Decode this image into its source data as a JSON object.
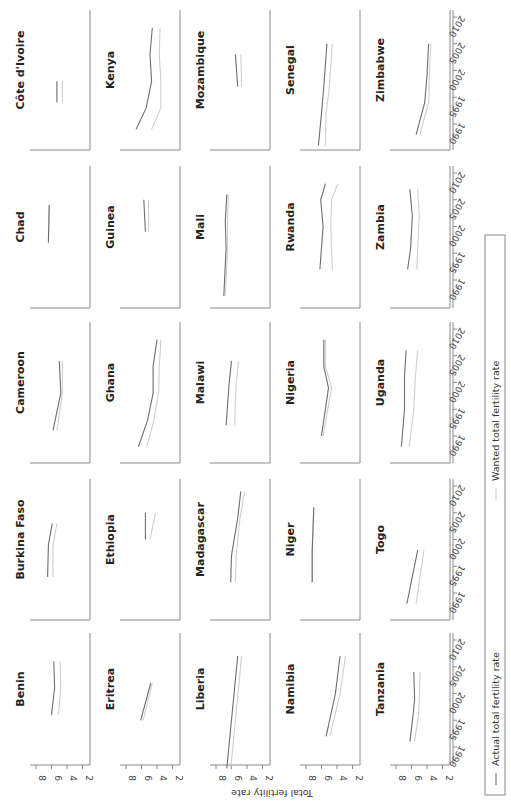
{
  "chart_data": {
    "type": "line",
    "layout": "small-multiples 5x5 grid, figure rotated 90deg counter-clockwise",
    "xlabel": "",
    "ylabel": "Total fertility rate",
    "x_ticks": [
      1990,
      1995,
      2000,
      2005,
      2010
    ],
    "y_ticks": [
      8,
      6,
      4,
      2
    ],
    "ylim": [
      1.5,
      9
    ],
    "xlim": [
      1985,
      2011
    ],
    "legend": [
      {
        "name": "Actual total fertility rate",
        "color": "#6e6e6e"
      },
      {
        "name": "Wanted total fertility rate",
        "color": "#cfcfcf"
      }
    ],
    "panels": [
      {
        "country": "Benin",
        "actual": [
          [
            1996,
            6.0
          ],
          [
            2001,
            5.6
          ],
          [
            2006,
            5.7
          ]
        ],
        "wanted": [
          [
            1996,
            5.1
          ],
          [
            2001,
            4.8
          ],
          [
            2006,
            4.9
          ]
        ]
      },
      {
        "country": "Burkina Faso",
        "actual": [
          [
            1993,
            6.5
          ],
          [
            1999,
            6.4
          ],
          [
            2003,
            5.9
          ]
        ],
        "wanted": [
          [
            1993,
            5.8
          ],
          [
            1999,
            5.8
          ],
          [
            2003,
            5.3
          ]
        ]
      },
      {
        "country": "Cameroon",
        "actual": [
          [
            1991,
            5.8
          ],
          [
            1998,
            4.8
          ],
          [
            2004,
            5.0
          ]
        ],
        "wanted": [
          [
            1991,
            5.3
          ],
          [
            1998,
            4.6
          ],
          [
            2004,
            4.6
          ]
        ]
      },
      {
        "country": "Chad",
        "actual": [
          [
            1997,
            6.4
          ],
          [
            2004,
            6.3
          ]
        ],
        "wanted": [
          [
            1997,
            6.4
          ],
          [
            2004,
            6.3
          ]
        ]
      },
      {
        "country": "Côte d'Ivoire",
        "actual": [
          [
            1994,
            5.3
          ],
          [
            1998,
            5.3
          ]
        ],
        "wanted": [
          [
            1994,
            4.6
          ],
          [
            1998,
            4.6
          ]
        ]
      },
      {
        "country": "Eritrea",
        "actual": [
          [
            1995,
            6.1
          ],
          [
            2002,
            4.8
          ]
        ],
        "wanted": [
          [
            1995,
            5.8
          ],
          [
            2002,
            4.6
          ]
        ]
      },
      {
        "country": "Ethiopia",
        "actual": [
          [
            2000,
            5.5
          ],
          [
            2005,
            5.5
          ]
        ],
        "wanted": [
          [
            2000,
            4.9
          ],
          [
            2005,
            4.2
          ]
        ]
      },
      {
        "country": "Ghana",
        "actual": [
          [
            1988,
            6.4
          ],
          [
            1993,
            5.2
          ],
          [
            1998,
            4.5
          ],
          [
            2003,
            4.5
          ],
          [
            2008,
            4.0
          ]
        ],
        "wanted": [
          [
            1988,
            5.3
          ],
          [
            1993,
            4.4
          ],
          [
            1998,
            3.8
          ],
          [
            2003,
            3.7
          ],
          [
            2008,
            3.5
          ]
        ]
      },
      {
        "country": "Guinea",
        "actual": [
          [
            1999,
            5.5
          ],
          [
            2005,
            5.7
          ]
        ],
        "wanted": [
          [
            1999,
            5.1
          ],
          [
            2005,
            5.1
          ]
        ]
      },
      {
        "country": "Kenya",
        "actual": [
          [
            1989,
            6.7
          ],
          [
            1993,
            5.4
          ],
          [
            1998,
            4.7
          ],
          [
            2003,
            4.9
          ],
          [
            2008,
            4.6
          ]
        ],
        "wanted": [
          [
            1989,
            4.7
          ],
          [
            1993,
            3.5
          ],
          [
            1998,
            3.5
          ],
          [
            2003,
            3.7
          ],
          [
            2008,
            3.6
          ]
        ]
      },
      {
        "country": "Liberia",
        "actual": [
          [
            1986,
            6.6
          ],
          [
            2007,
            5.2
          ]
        ],
        "wanted": [
          [
            1986,
            6.1
          ],
          [
            2007,
            4.7
          ]
        ]
      },
      {
        "country": "Madagascar",
        "actual": [
          [
            1992,
            6.1
          ],
          [
            1997,
            6.0
          ],
          [
            2004,
            5.2
          ],
          [
            2009,
            4.8
          ]
        ],
        "wanted": [
          [
            1992,
            5.5
          ],
          [
            1997,
            5.4
          ],
          [
            2004,
            4.9
          ],
          [
            2009,
            4.3
          ]
        ]
      },
      {
        "country": "Malawi",
        "actual": [
          [
            1992,
            6.7
          ],
          [
            2000,
            6.3
          ],
          [
            2004,
            6.0
          ]
        ],
        "wanted": [
          [
            1992,
            5.6
          ],
          [
            2000,
            5.4
          ],
          [
            2004,
            5.1
          ]
        ]
      },
      {
        "country": "Mali",
        "actual": [
          [
            1987,
            7.0
          ],
          [
            1996,
            6.7
          ],
          [
            2001,
            6.8
          ],
          [
            2006,
            6.6
          ]
        ],
        "wanted": [
          [
            1987,
            6.8
          ],
          [
            1996,
            6.5
          ],
          [
            2001,
            6.5
          ],
          [
            2006,
            6.4
          ]
        ]
      },
      {
        "country": "Mozambique",
        "actual": [
          [
            1997,
            5.2
          ],
          [
            2003,
            5.5
          ]
        ],
        "wanted": [
          [
            1997,
            4.7
          ],
          [
            2003,
            4.8
          ]
        ]
      },
      {
        "country": "Namibia",
        "actual": [
          [
            1992,
            5.4
          ],
          [
            2000,
            4.2
          ],
          [
            2007,
            3.6
          ]
        ],
        "wanted": [
          [
            1992,
            4.9
          ],
          [
            2000,
            3.6
          ],
          [
            2007,
            2.9
          ]
        ]
      },
      {
        "country": "Niger",
        "actual": [
          [
            1992,
            7.2
          ],
          [
            1998,
            7.2
          ],
          [
            2006,
            7.0
          ]
        ],
        "wanted": [
          [
            1992,
            7.2
          ],
          [
            1998,
            7.2
          ],
          [
            2006,
            7.0
          ]
        ]
      },
      {
        "country": "Nigeria",
        "actual": [
          [
            1990,
            6.0
          ],
          [
            1999,
            5.1
          ],
          [
            2003,
            5.7
          ],
          [
            2008,
            5.7
          ]
        ],
        "wanted": [
          [
            1990,
            5.8
          ],
          [
            1999,
            4.7
          ],
          [
            2003,
            5.5
          ],
          [
            2008,
            5.5
          ]
        ]
      },
      {
        "country": "Rwanda",
        "actual": [
          [
            1992,
            6.2
          ],
          [
            2000,
            5.8
          ],
          [
            2005,
            6.1
          ],
          [
            2008,
            5.5
          ]
        ],
        "wanted": [
          [
            1992,
            4.6
          ],
          [
            2000,
            4.8
          ],
          [
            2005,
            4.7
          ],
          [
            2008,
            3.9
          ]
        ]
      },
      {
        "country": "Senegal",
        "actual": [
          [
            1986,
            6.4
          ],
          [
            1992,
            6.0
          ],
          [
            1997,
            5.7
          ],
          [
            2005,
            5.3
          ]
        ],
        "wanted": [
          [
            1986,
            5.5
          ],
          [
            1992,
            5.4
          ],
          [
            1997,
            5.0
          ],
          [
            2005,
            4.6
          ]
        ]
      },
      {
        "country": "Tanzania",
        "actual": [
          [
            1991,
            6.2
          ],
          [
            1996,
            5.8
          ],
          [
            1999,
            5.6
          ],
          [
            2004,
            5.7
          ]
        ],
        "wanted": [
          [
            1991,
            5.6
          ],
          [
            1996,
            5.1
          ],
          [
            1999,
            5.0
          ],
          [
            2004,
            4.9
          ]
        ]
      },
      {
        "country": "Togo",
        "actual": [
          [
            1988,
            6.6
          ],
          [
            1998,
            5.2
          ]
        ],
        "wanted": [
          [
            1988,
            5.4
          ],
          [
            1998,
            4.4
          ]
        ]
      },
      {
        "country": "Uganda",
        "actual": [
          [
            1988,
            7.3
          ],
          [
            1995,
            6.9
          ],
          [
            2001,
            6.9
          ],
          [
            2006,
            6.7
          ]
        ],
        "wanted": [
          [
            1988,
            6.3
          ],
          [
            1995,
            5.7
          ],
          [
            2001,
            5.5
          ],
          [
            2006,
            5.2
          ]
        ]
      },
      {
        "country": "Zambia",
        "actual": [
          [
            1992,
            6.5
          ],
          [
            1996,
            6.1
          ],
          [
            2002,
            5.9
          ],
          [
            2007,
            6.2
          ]
        ],
        "wanted": [
          [
            1992,
            5.3
          ],
          [
            1996,
            5.2
          ],
          [
            2002,
            5.0
          ],
          [
            2007,
            5.2
          ]
        ]
      },
      {
        "country": "Zimbabwe",
        "actual": [
          [
            1988,
            5.4
          ],
          [
            1994,
            4.3
          ],
          [
            1999,
            4.0
          ],
          [
            2005,
            3.8
          ]
        ],
        "wanted": [
          [
            1988,
            4.9
          ],
          [
            1994,
            3.8
          ],
          [
            1999,
            3.7
          ],
          [
            2005,
            3.5
          ]
        ]
      }
    ]
  }
}
